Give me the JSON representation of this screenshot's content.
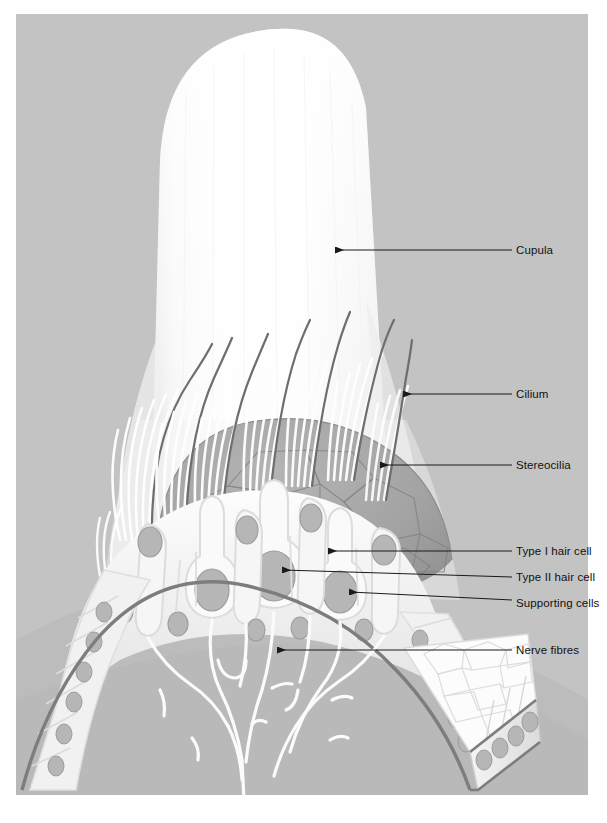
{
  "figure": {
    "background_color": "#c3c3c3",
    "panel": {
      "x": 16,
      "y": 14,
      "width": 572,
      "height": 781
    },
    "canvas": {
      "width": 607,
      "height": 823
    }
  },
  "palette": {
    "page_white": "#ffffff",
    "panel_gray": "#c3c3c3",
    "cupula_white": "#fbfbfb",
    "dome_gray": "#a2a2a2",
    "dome_line": "#8a8a8a",
    "cell_light": "#f2f2f2",
    "cell_white": "#fafafa",
    "nucleus_gray": "#b6b6b6",
    "nucleus_edge": "#9a9a9a",
    "basement_dark": "#7d7d7d",
    "kinocilium_dark": "#6e6e6e",
    "stereocilia_light": "#ffffff",
    "leader_line": "#1a1a1a",
    "label_text": "#111111",
    "subepithelium": "#bdbdbd"
  },
  "labels": [
    {
      "id": "cupula",
      "text": "Cupula",
      "x": 516,
      "y": 245,
      "leader": {
        "x1": 512,
        "y1": 250,
        "x2": 336,
        "y2": 250,
        "arrow": "left"
      }
    },
    {
      "id": "cilium",
      "text": "Cilium",
      "x": 516,
      "y": 389,
      "leader": {
        "x1": 512,
        "y1": 394,
        "x2": 404,
        "y2": 394,
        "arrow": "left"
      }
    },
    {
      "id": "stereocilia",
      "text": "Stereocilia",
      "x": 516,
      "y": 460,
      "leader": {
        "x1": 512,
        "y1": 465,
        "x2": 381,
        "y2": 465,
        "arrow": "left"
      }
    },
    {
      "id": "type-i",
      "text": "Type I hair cell",
      "x": 516,
      "y": 546,
      "leader": {
        "x1": 512,
        "y1": 551,
        "x2": 329,
        "y2": 551,
        "arrow": "left"
      }
    },
    {
      "id": "type-ii",
      "text": "Type II hair cell",
      "x": 516,
      "y": 572,
      "leader": {
        "x1": 512,
        "y1": 577,
        "x2": 283,
        "y2": 570,
        "arrow": "left"
      }
    },
    {
      "id": "supporting",
      "text": "Supporting cells",
      "x": 516,
      "y": 598,
      "leader": {
        "x1": 512,
        "y1": 600,
        "x2": 350,
        "y2": 592,
        "arrow": "left"
      }
    },
    {
      "id": "nerve-fibres",
      "text": "Nerve fibres",
      "x": 516,
      "y": 645,
      "leader": {
        "x1": 512,
        "y1": 650,
        "x2": 278,
        "y2": 650,
        "arrow": "left"
      }
    }
  ],
  "structures": {
    "cupula": {
      "name": "Cupula",
      "description": "Gelatinous dome rising from the crista surface"
    },
    "cilium": {
      "name": "Cilium",
      "description": "Long dark kinocilium of each hair cell",
      "count": 9
    },
    "stereocilia": {
      "name": "Stereocilia",
      "description": "Graded bundles of fine pale stereocilia",
      "bundles": 9
    },
    "type_i": {
      "name": "Type I hair cell",
      "description": "Flask-shaped cell with rounded base and large nucleus",
      "count": 3
    },
    "type_ii": {
      "name": "Type II hair cell",
      "description": "Columnar cell extending to the basement membrane",
      "count": 4
    },
    "supporting": {
      "name": "Supporting cells",
      "description": "Tall cells between hair cells resting on basement membrane"
    },
    "nerve_fibres": {
      "name": "Nerve fibres",
      "description": "Branching afferent fibres below the basement membrane"
    },
    "epithelium": {
      "name": "Sensory epithelium",
      "description": "Apical mosaic of polygonal cell outlines"
    }
  }
}
